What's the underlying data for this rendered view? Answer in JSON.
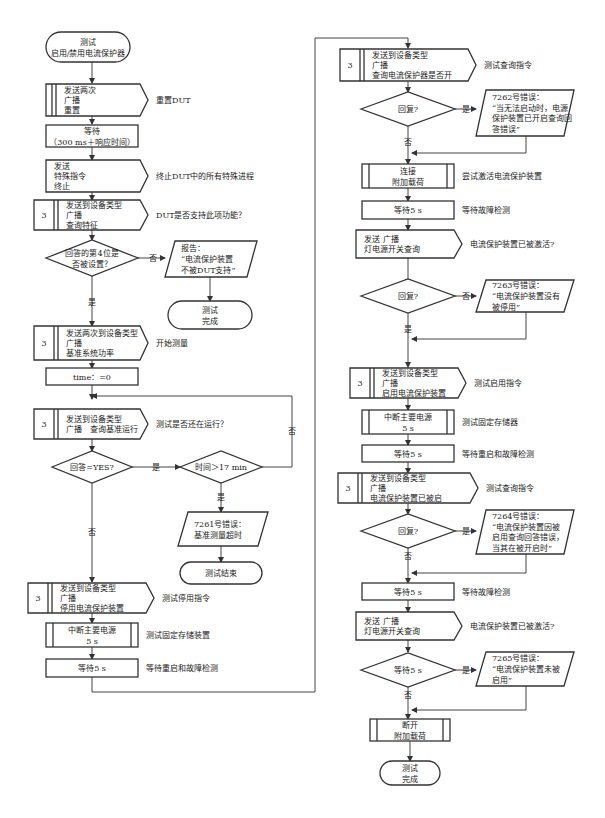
{
  "colors": {
    "stroke": "#333333",
    "line": "#444444",
    "text": "#1a1a1a",
    "background": "#ffffff"
  },
  "left_column": {
    "start": {
      "lines": [
        "测试",
        "启用/禁用电流保护器"
      ]
    },
    "reset": {
      "lines": [
        "发送两次",
        "广播",
        "重置"
      ],
      "note": "重置DUT"
    },
    "wait_response": {
      "lines": [
        "等待",
        "（300 ms＋响应时间）"
      ]
    },
    "terminate": {
      "lines": [
        "发送",
        "特殊指令",
        "终止"
      ],
      "note": "终止DUT中的所有特殊进程"
    },
    "query_features": {
      "num": "3",
      "lines": [
        "发送到设备类型",
        "广播",
        "查询特征"
      ],
      "note": "DUT是否支持此项功能？"
    },
    "bit4_decision": {
      "lines": [
        "回答的第4位是",
        "否被设置？"
      ],
      "yes": "是",
      "no": "否"
    },
    "report_unsupported": {
      "lines": [
        "报告：",
        "“电流保护装置",
        "不被DUT支持”"
      ]
    },
    "test_done_1": {
      "lines": [
        "测试",
        "完成"
      ]
    },
    "reference_power": {
      "num": "3",
      "lines": [
        "发送两次到设备类型",
        "广播",
        "基准系统功率"
      ],
      "note": "开始测量"
    },
    "time_reset": {
      "lines": [
        "time：=0"
      ]
    },
    "query_reference_running": {
      "num": "3",
      "lines": [
        "发送到设备类型",
        "广播　查询基准运行"
      ],
      "note": "测试是否还在运行？"
    },
    "answer_yes_decision": {
      "lines": [
        "回答=YES?"
      ],
      "yes": "是",
      "no": "否"
    },
    "time_decision": {
      "lines": [
        "时间＞17  min"
      ],
      "yes": "是",
      "no": "否"
    },
    "error_7261": {
      "lines": [
        "7261号错误：",
        "基准测量超时"
      ]
    },
    "test_end": {
      "lines": [
        "测试结束"
      ]
    },
    "disable_protector": {
      "num": "3",
      "lines": [
        "发送到设备类型",
        "广播",
        "停用电流保护装置"
      ],
      "note": "测试停用指令"
    },
    "cut_power_1": {
      "lines": [
        "中断主要电源",
        "5  s"
      ],
      "note": "测试固定存储装置"
    },
    "wait_5s_1": {
      "lines": [
        "等待5  s"
      ],
      "note": "等待重启和故障检测"
    }
  },
  "right_column": {
    "query_protector_on": {
      "num": "3",
      "lines": [
        "发送到设备类型",
        "广播",
        "查询电流保护器是否开"
      ],
      "note": "测试查询指令"
    },
    "reply_decision_1": {
      "lines": [
        "回复?"
      ],
      "yes": "是",
      "no": "否"
    },
    "error_7262": {
      "lines": [
        "7262号错误：",
        "“当无法启动时，电源",
        "保护装置已开启查询回",
        "答错误”"
      ]
    },
    "connect_load": {
      "lines": [
        "连接",
        "附加载荷"
      ],
      "note": "尝试激活电流保护装置"
    },
    "wait_5s_2": {
      "lines": [
        "等待5  s"
      ],
      "note": "等待故障检测"
    },
    "lamp_query_1": {
      "lines": [
        "发送  广播",
        "灯电源开关查询"
      ],
      "note": "电流保护装置已被激活?"
    },
    "reply_decision_2": {
      "lines": [
        "回复?"
      ],
      "yes": "是",
      "no": "否"
    },
    "error_7263": {
      "lines": [
        "7263号错误：",
        "“电流保护装置没有",
        "被停用”"
      ]
    },
    "enable_protector": {
      "num": "3",
      "lines": [
        "发送到设备类型",
        "广播",
        "启用电流保护装置"
      ],
      "note": "测试启用指令"
    },
    "cut_power_2": {
      "lines": [
        "中断主要电源",
        "5  s"
      ],
      "note": "测试固定存储器"
    },
    "wait_5s_3": {
      "lines": [
        "等待5  s"
      ],
      "note": "等待重启和故障检测"
    },
    "query_enabled": {
      "num": "3",
      "lines": [
        "发送到设备类型",
        "广播",
        "电流保护装置已被启"
      ],
      "note": "测试查询指令"
    },
    "reply_decision_3": {
      "lines": [
        "回复?"
      ],
      "yes": "是",
      "no": "否"
    },
    "error_7264": {
      "lines": [
        "7264号错误：",
        "“电流保护装置因被",
        "启用查询回答错误，",
        "当其在被开启时”"
      ]
    },
    "wait_5s_4": {
      "lines": [
        "等待5  s"
      ],
      "note": "等待故障检测"
    },
    "lamp_query_2": {
      "lines": [
        "发送  广播",
        "灯电源开关查询"
      ],
      "note": "电流保护装置已被激活?"
    },
    "wait_decision": {
      "lines": [
        "等待5  s"
      ],
      "yes": "是",
      "no": "否"
    },
    "error_7265": {
      "lines": [
        "7265号错误：",
        "“电流保护装置未被",
        "启用”"
      ]
    },
    "disconnect_load": {
      "lines": [
        "断开",
        "附加载荷"
      ]
    },
    "test_done_2": {
      "lines": [
        "测试",
        "完成"
      ]
    }
  }
}
